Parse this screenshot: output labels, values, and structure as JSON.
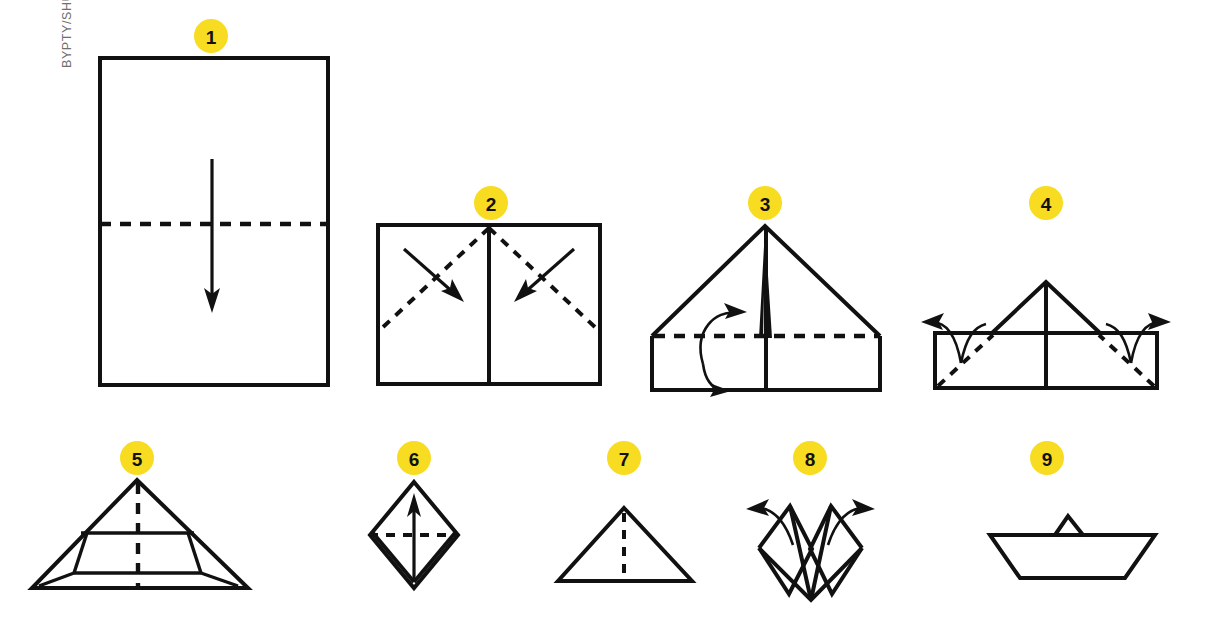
{
  "figure": {
    "title_visible": false,
    "watermark": "BYPTY/SHUTTERSTOCK",
    "background_color": "#FFFFFF",
    "ink_color": "#111111",
    "badge_color": "#F7DC21",
    "badge_text_color": "#111111",
    "type": "origami-instruction-diagram"
  },
  "steps": [
    {
      "number": "1",
      "badge_x": 211,
      "badge_y": 36,
      "name": "step-1-rectangle-fold-in-half",
      "description": "Portrait rectangle sheet with horizontal dashed fold line across the middle and a downward arrow",
      "shape": "rectangle",
      "fold": "valley-horizontal",
      "arrow": "down"
    },
    {
      "number": "2",
      "badge_x": 491,
      "badge_y": 203,
      "name": "step-2-fold-corners-to-center",
      "description": "Rectangle with centre vertical crease, two dashed diagonals from top centre and two arrows pointing inward",
      "shape": "rectangle",
      "fold": "two-diagonals",
      "arrow": "two-inward"
    },
    {
      "number": "3",
      "badge_x": 765,
      "badge_y": 203,
      "name": "step-3-fold-brim-up",
      "description": "Triangle roof over rectangle band, centre slit at apex, horizontal dashed fold and a curved arrow folding the band up",
      "shape": "house",
      "fold": "valley-horizontal",
      "arrow": "curved-up-left"
    },
    {
      "number": "4",
      "badge_x": 1046,
      "badge_y": 203,
      "name": "step-4-fold-side-corners-back",
      "description": "Small triangle over a wide band, dashed diagonals at both lower corners, two curved arrows folding corners to the back",
      "shape": "hat",
      "fold": "two-corner-diagonals",
      "arrow": "two-outward-curved"
    },
    {
      "number": "5",
      "badge_x": 137,
      "badge_y": 458,
      "name": "step-5-triangle-hat",
      "description": "Wide triangle hat with inner folded band and vertical dashed centre line",
      "shape": "triangle-hat",
      "fold": "valley-vertical",
      "arrow": "none"
    },
    {
      "number": "6",
      "badge_x": 414,
      "badge_y": 458,
      "name": "step-6-open-into-square",
      "description": "Square opened into a diamond, horizontal dashed fold line and an upward arrow",
      "shape": "diamond",
      "fold": "valley-horizontal",
      "arrow": "up"
    },
    {
      "number": "7",
      "badge_x": 624,
      "badge_y": 458,
      "name": "step-7-small-triangle",
      "description": "Small triangle with a vertical dashed centre line",
      "shape": "triangle",
      "fold": "valley-vertical",
      "arrow": "none"
    },
    {
      "number": "8",
      "badge_x": 810,
      "badge_y": 458,
      "name": "step-8-pull-sides-apart",
      "description": "Diamond with two peaks and a centre notch, two curved arrows pulling the sides outward",
      "shape": "double-peak-diamond",
      "fold": "open-out",
      "arrow": "two-outward-curved"
    },
    {
      "number": "9",
      "badge_x": 1047,
      "badge_y": 458,
      "name": "step-9-finished-boat",
      "description": "Finished paper boat seen from the side with a small raised peak in the middle",
      "shape": "boat",
      "fold": "none",
      "arrow": "none"
    }
  ]
}
